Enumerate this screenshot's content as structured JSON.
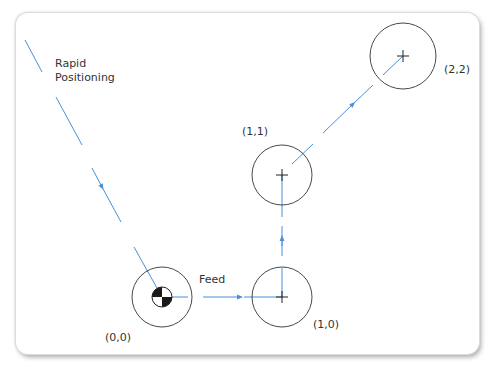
{
  "diagram": {
    "labels": {
      "rapid_line1": "Rapid",
      "rapid_line2": "Positioning",
      "feed": "Feed",
      "p00": "(0,0)",
      "p10": "(1,0)",
      "p11": "(1,1)",
      "p22": "(2,2)"
    },
    "points": [
      {
        "name": "(0,0)",
        "cx": 162,
        "cy": 297,
        "r": 30,
        "marker": "origin-checker"
      },
      {
        "name": "(1,0)",
        "cx": 282,
        "cy": 297,
        "r": 30,
        "marker": "crosshair"
      },
      {
        "name": "(1,1)",
        "cx": 282,
        "cy": 175,
        "r": 30,
        "marker": "crosshair"
      },
      {
        "name": "(2,2)",
        "cx": 403,
        "cy": 56,
        "r": 33,
        "marker": "crosshair"
      }
    ],
    "colors": {
      "path": "#4a8fd6",
      "circle": "#333333",
      "frame_shadow": "#bbbbbb"
    }
  }
}
